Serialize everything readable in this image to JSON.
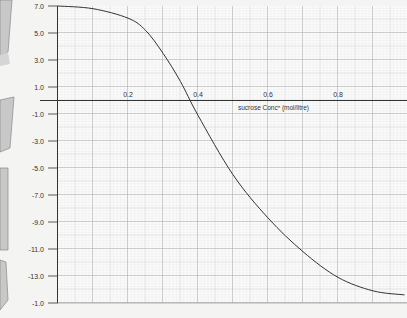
{
  "chart_data": {
    "type": "line",
    "title": "",
    "xlabel": "sucrose Concⁿ (mol/litre)",
    "ylabel": "",
    "x_ticks": [
      "0.2",
      "0.4",
      "0.6",
      "0.8"
    ],
    "y_ticks": [
      "7.0",
      "5.0",
      "3.0",
      "1.0",
      "-1.0",
      "-3.0",
      "-5.0",
      "-7.0",
      "-9.0",
      "-11.0",
      "-13.0",
      "-1.0"
    ],
    "xlim": [
      0.0,
      1.0
    ],
    "ylim": [
      -15.0,
      7.0
    ],
    "grid": true,
    "legend": null,
    "series": [
      {
        "name": "curve",
        "x": [
          0.0,
          0.1,
          0.2,
          0.25,
          0.3,
          0.35,
          0.4,
          0.5,
          0.6,
          0.7,
          0.8,
          0.9,
          0.99
        ],
        "y": [
          7.0,
          6.8,
          6.1,
          5.2,
          3.5,
          1.4,
          -1.1,
          -5.5,
          -8.7,
          -11.2,
          -13.1,
          -14.1,
          -14.4
        ]
      }
    ]
  },
  "colors": {
    "background": "#f4f4f2",
    "grid_minor": "#d9d9d9",
    "grid_major": "#b5b5b5",
    "axis": "#333333",
    "curve": "#333333",
    "deco": "#bdbdbd"
  }
}
